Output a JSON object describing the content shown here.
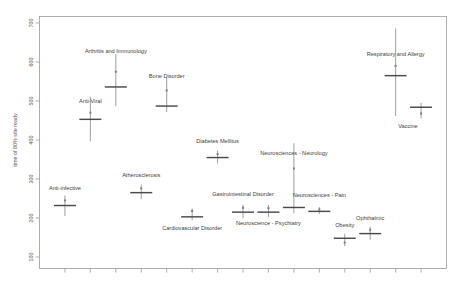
{
  "chart_data": {
    "type": "scatter",
    "title": "",
    "xlabel": "",
    "ylabel": "time of 80% site ready",
    "ylim": [
      100,
      700
    ],
    "yticks": [
      100,
      200,
      300,
      400,
      500,
      600,
      700
    ],
    "ytick_labels": [
      "100",
      "200",
      "300",
      "400",
      "500",
      "600",
      "700"
    ],
    "xlim": [
      0,
      16
    ],
    "xticks": [
      1,
      2,
      3,
      4,
      5,
      6,
      7,
      8,
      9,
      10,
      11,
      12,
      13,
      14,
      15
    ],
    "xtick_labels": [
      "",
      "",
      "",
      "",
      "",
      "",
      "",
      "",
      "",
      "",
      "",
      "",
      "",
      "",
      ""
    ],
    "grid": false,
    "legend": "none",
    "marker_style": "horizontal-bar-with-vertical-error-line",
    "points": [
      {
        "label": "Anti-infective",
        "x": 1,
        "estimate": 232,
        "low": 205,
        "high": 258,
        "dot": 245,
        "label_dy": -16
      },
      {
        "label": "Anti-Viral",
        "x": 2,
        "estimate": 453,
        "low": 397,
        "high": 511,
        "dot": 470,
        "label_dy": -16
      },
      {
        "label": "Arthritis and Immunology",
        "x": 3,
        "estimate": 536,
        "low": 487,
        "high": 620,
        "dot": 575,
        "label_dy": -34
      },
      {
        "label": "Atherosclerosis",
        "x": 4,
        "estimate": 265,
        "low": 248,
        "high": 286,
        "dot": 276,
        "label_dy": -16
      },
      {
        "label": "Bone Disorder",
        "x": 5,
        "estimate": 487,
        "low": 472,
        "high": 560,
        "dot": 527,
        "label_dy": -28
      },
      {
        "label": "Cardiovascular Disorder",
        "x": 6,
        "estimate": 203,
        "low": 195,
        "high": 224,
        "dot": 218,
        "label_dy": 13
      },
      {
        "label": "Diabetes Mellitus",
        "x": 7,
        "estimate": 355,
        "low": 340,
        "high": 373,
        "dot": 364,
        "label_dy": -15
      },
      {
        "label": "Gastrointestinal Disorder",
        "x": 8,
        "estimate": 215,
        "low": 199,
        "high": 234,
        "dot": 226,
        "label_dy": -16
      },
      {
        "label": "Neuroscience - Psychiatry",
        "x": 9,
        "estimate": 215,
        "low": 202,
        "high": 234,
        "dot": 225,
        "label_dy": 13
      },
      {
        "label": "Neurosciences - Neurology",
        "x": 10,
        "estimate": 227,
        "low": 212,
        "high": 392,
        "dot": 327,
        "label_dy": -52
      },
      {
        "label": "Neurosciences - Pain",
        "x": 11,
        "estimate": 217,
        "low": 210,
        "high": 228,
        "dot": 222,
        "label_dy": -14
      },
      {
        "label": "Obesity",
        "x": 12,
        "estimate": 148,
        "low": 128,
        "high": 160,
        "dot": 137,
        "label_dy": -11
      },
      {
        "label": "Ophthalmic",
        "x": 13,
        "estimate": 160,
        "low": 144,
        "high": 178,
        "dot": 170,
        "label_dy": -14
      },
      {
        "label": "Respiratory and Allergy",
        "x": 14,
        "estimate": 565,
        "low": 462,
        "high": 686,
        "dot": 590,
        "label_dy": -20
      },
      {
        "label": "Vaccine",
        "x": 15,
        "estimate": 484,
        "low": 455,
        "high": 495,
        "dot": 468,
        "label_dy": 21
      }
    ]
  }
}
